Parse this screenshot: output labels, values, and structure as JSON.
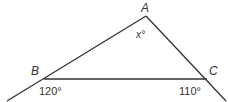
{
  "diagram": {
    "type": "triangle",
    "vertices": [
      {
        "id": "A",
        "label": "A"
      },
      {
        "id": "B",
        "label": "B"
      },
      {
        "id": "C",
        "label": "C"
      }
    ],
    "angles": {
      "interior_A": "x°",
      "exterior_B": "120°",
      "exterior_C": "110°"
    },
    "stroke_color": "#333333",
    "background": "#ffffff"
  }
}
